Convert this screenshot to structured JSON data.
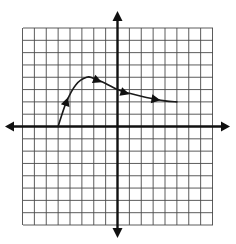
{
  "chart_data": {
    "type": "line",
    "title": "",
    "xlabel": "",
    "ylabel": "",
    "xlim": [
      -8,
      8
    ],
    "ylim": [
      -8,
      8
    ],
    "grid": true,
    "grid_step": 1,
    "axes_arrows": true,
    "series": [
      {
        "name": "curve",
        "x": [
          -5,
          -4.3,
          -3.5,
          -2.6,
          -2.0,
          -1,
          0,
          1,
          2,
          3,
          4,
          5
        ],
        "y": [
          0,
          2,
          3.4,
          4.0,
          3.9,
          3.5,
          3.0,
          2.7,
          2.45,
          2.25,
          2.08,
          2.0
        ],
        "direction_arrows": [
          {
            "x": -4.3,
            "y": 2.0
          },
          {
            "x": -1.7,
            "y": 3.75
          },
          {
            "x": 0.6,
            "y": 2.75
          },
          {
            "x": 3.2,
            "y": 2.2
          }
        ]
      }
    ]
  },
  "colors": {
    "grid": "#4a4a4a",
    "axes": "#111111",
    "curve": "#1a1a1a",
    "background": "#ffffff"
  }
}
